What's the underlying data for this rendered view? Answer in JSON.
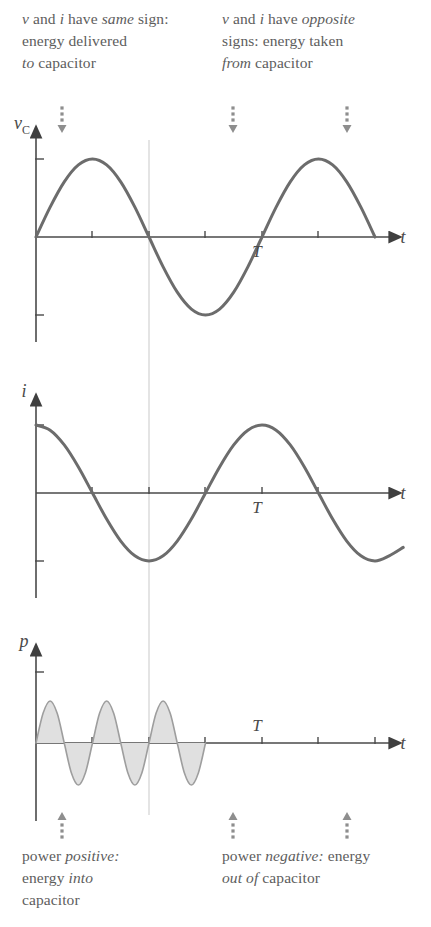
{
  "figure": {
    "background_color": "#ffffff",
    "curve_color": "#6c6c6c",
    "axis_color": "#4a4a4a",
    "fill_color": "#e0e0e0",
    "annotation_color": "#8e8e8e",
    "guide_color": "#c9c9c9"
  },
  "annotations": {
    "top_left": {
      "line1_a": "v",
      "line1_b": " and ",
      "line1_c": "i",
      "line1_d": " have ",
      "line1_e": "same",
      "line1_f": " sign:",
      "line2": "energy delivered",
      "line3_a": "to",
      "line3_b": " capacitor"
    },
    "top_right": {
      "line1_a": "v",
      "line1_b": " and ",
      "line1_c": "i",
      "line1_d": " have ",
      "line1_e": "opposite",
      "line2": "signs: energy taken",
      "line3_a": "from",
      "line3_b": " capacitor"
    },
    "bottom_left": {
      "line1_a": "power ",
      "line1_b": "positive:",
      "line2_a": "energy ",
      "line2_b": "into",
      "line3": "capacitor"
    },
    "bottom_right": {
      "line1_a": "power ",
      "line1_b": "negative:",
      "line1_c": " energy",
      "line2_a": "out of",
      "line2_b": " capacitor"
    },
    "pointer_arrows": {
      "top": [
        {
          "name": "arrow-top-1",
          "x": 62,
          "direction": "down"
        },
        {
          "name": "arrow-top-2",
          "x": 233,
          "direction": "down"
        },
        {
          "name": "arrow-top-3",
          "x": 347,
          "direction": "down"
        }
      ],
      "bottom": [
        {
          "name": "arrow-bottom-1",
          "x": 62,
          "direction": "up"
        },
        {
          "name": "arrow-bottom-2",
          "x": 233,
          "direction": "up"
        },
        {
          "name": "arrow-bottom-3",
          "x": 347,
          "direction": "up"
        }
      ]
    }
  },
  "chart_data": [
    {
      "type": "line",
      "name": "capacitor-voltage",
      "title": "",
      "ylabel": "v_C",
      "ylabel_base": "v",
      "ylabel_sub": "C",
      "xlabel": "t",
      "period_label": "T",
      "period_label_x": 262,
      "function": "sin",
      "amplitude": 1,
      "phase_deg": 0,
      "cycles": 1.5,
      "period_px": 226,
      "x_start_px": 36,
      "zero_line_y_px": 237,
      "amplitude_px": 78,
      "x_ticks": [
        92,
        149,
        205,
        262,
        318
      ],
      "y_ticks": [
        "+Vm",
        "-Vm"
      ],
      "grid": false,
      "x": [
        0,
        0.0625,
        0.125,
        0.1875,
        0.25,
        0.3125,
        0.375,
        0.4375,
        0.5,
        0.5625,
        0.625,
        0.6875,
        0.75,
        0.8125,
        0.875,
        0.9375,
        1.0,
        1.0625,
        1.125,
        1.1875,
        1.25,
        1.3125,
        1.375,
        1.4375,
        1.5
      ],
      "y": [
        0.0,
        0.383,
        0.707,
        0.924,
        1.0,
        0.924,
        0.707,
        0.383,
        0.0,
        -0.383,
        -0.707,
        -0.924,
        -1.0,
        -0.924,
        -0.707,
        -0.383,
        0.0,
        0.383,
        0.707,
        0.924,
        1.0,
        0.924,
        0.707,
        0.383,
        0.0
      ]
    },
    {
      "type": "line",
      "name": "capacitor-current",
      "title": "",
      "ylabel": "i",
      "xlabel": "t",
      "period_label": "T",
      "period_label_x": 262,
      "function": "cos",
      "amplitude": 1,
      "phase_deg": 90,
      "cycles": 1.5,
      "period_px": 226,
      "x_start_px": 36,
      "zero_line_y_px": 493,
      "amplitude_px": 68,
      "x_ticks": [
        92,
        149,
        205,
        262,
        318
      ],
      "y_ticks": [
        "+Im",
        "-Im"
      ],
      "grid": false,
      "x": [
        0,
        0.0625,
        0.125,
        0.1875,
        0.25,
        0.3125,
        0.375,
        0.4375,
        0.5,
        0.5625,
        0.625,
        0.6875,
        0.75,
        0.8125,
        0.875,
        0.9375,
        1.0,
        1.0625,
        1.125,
        1.1875,
        1.25,
        1.3125,
        1.375,
        1.4375,
        1.5,
        1.5625,
        1.625
      ],
      "y": [
        1.0,
        0.924,
        0.707,
        0.383,
        0.0,
        -0.383,
        -0.707,
        -0.924,
        -1.0,
        -0.924,
        -0.707,
        -0.383,
        0.0,
        0.383,
        0.707,
        0.924,
        1.0,
        0.924,
        0.707,
        0.383,
        0.0,
        -0.383,
        -0.707,
        -0.924,
        -1.0,
        -0.924,
        -0.8
      ]
    },
    {
      "type": "area",
      "name": "capacitor-power",
      "title": "",
      "ylabel": "p",
      "xlabel": "t",
      "period_label": "T",
      "period_label_x": 262,
      "function": "sin(2x)",
      "amplitude": 0.5,
      "cycles": 3,
      "period_px": 113,
      "x_start_px": 36,
      "zero_line_y_px": 743,
      "amplitude_px": 42,
      "x_ticks": [
        92,
        149,
        205,
        262,
        318,
        375
      ],
      "y_ticks": [
        "+Pm"
      ],
      "grid": false,
      "filled": true,
      "x": [
        0,
        0.0625,
        0.125,
        0.1875,
        0.25,
        0.3125,
        0.375,
        0.4375,
        0.5,
        0.5625,
        0.625,
        0.6875,
        0.75,
        0.8125,
        0.875,
        0.9375,
        1.0,
        1.0625,
        1.125,
        1.1875,
        1.25,
        1.3125,
        1.375,
        1.4375,
        1.5
      ],
      "y": [
        0.0,
        0.707,
        1.0,
        0.707,
        0.0,
        -0.707,
        -1.0,
        -0.707,
        0.0,
        0.707,
        1.0,
        0.707,
        0.0,
        -0.707,
        -1.0,
        -0.707,
        0.0,
        0.707,
        1.0,
        0.707,
        0.0,
        -0.707,
        -1.0,
        -0.707,
        0.0
      ]
    }
  ],
  "guide_line": {
    "name": "vertical-guide",
    "x_px": 149,
    "y_top_px": 140,
    "y_bottom_px": 815
  }
}
